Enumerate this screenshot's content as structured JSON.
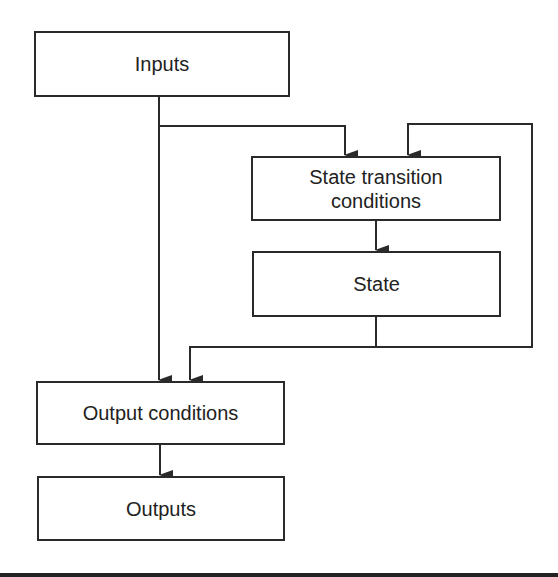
{
  "diagram": {
    "type": "flowchart",
    "title": "",
    "nodes": [
      {
        "id": "inputs",
        "label": "Inputs"
      },
      {
        "id": "state_transition",
        "label": "State transition conditions",
        "lines": [
          "State transition",
          "conditions"
        ]
      },
      {
        "id": "state",
        "label": "State"
      },
      {
        "id": "output_conditions",
        "label": "Output conditions"
      },
      {
        "id": "outputs",
        "label": "Outputs"
      }
    ],
    "edges": [
      {
        "from": "inputs",
        "to": "state_transition"
      },
      {
        "from": "inputs",
        "to": "output_conditions"
      },
      {
        "from": "state_transition",
        "to": "state"
      },
      {
        "from": "state",
        "to": "state_transition",
        "note": "feedback loop"
      },
      {
        "from": "state",
        "to": "output_conditions"
      },
      {
        "from": "output_conditions",
        "to": "outputs"
      }
    ],
    "colors": {
      "stroke": "#2a2a2a",
      "background": "#ffffff",
      "text": "#222222"
    }
  }
}
